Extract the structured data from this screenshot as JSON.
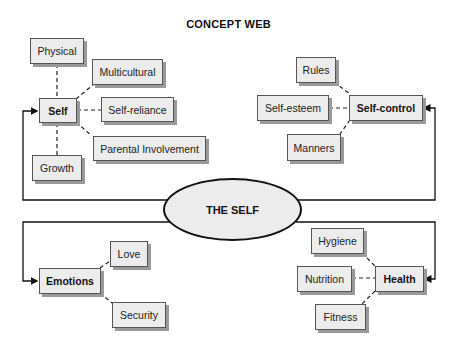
{
  "title": "CONCEPT WEB",
  "center": {
    "label": "THE SELF"
  },
  "quadrants": {
    "self": {
      "hub": "Self",
      "children": [
        "Physical",
        "Multicultural",
        "Self-reliance",
        "Parental Involvement",
        "Growth"
      ]
    },
    "self_control": {
      "hub": "Self-control",
      "children": [
        "Rules",
        "Self-esteem",
        "Manners"
      ]
    },
    "emotions": {
      "hub": "Emotions",
      "children": [
        "Love",
        "Security"
      ]
    },
    "health": {
      "hub": "Health",
      "children": [
        "Hygiene",
        "Nutrition",
        "Fitness"
      ]
    }
  },
  "colors": {
    "box_fill": "#ececec",
    "box_border": "#555555",
    "shadow": "#9a9a9a",
    "line": "#111111"
  }
}
